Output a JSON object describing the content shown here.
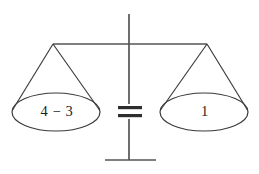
{
  "figure": {
    "background_color": "#ffffff",
    "line_color": "#3a3a3a",
    "post_color": "#555555",
    "text_color": "#1d1d1d"
  },
  "left_pan": {
    "label": "4 − 3",
    "expression_operand_a": "4",
    "expression_operator": "−",
    "expression_operand_b": "3",
    "value": 1
  },
  "right_pan": {
    "label": "1",
    "value": 1
  },
  "center": {
    "relation_symbol": "=",
    "relation_name": "equals-sign"
  },
  "geometry": {
    "beam": {
      "x1": 53,
      "y1": 44,
      "x2": 207,
      "y2": 44
    },
    "post": {
      "x": 129,
      "y_top": 14,
      "y_bottom": 160
    },
    "base": {
      "x1": 105,
      "x2": 156,
      "y": 160
    },
    "left_apex": {
      "x": 53,
      "y": 44
    },
    "right_apex": {
      "x": 207,
      "y": 44
    },
    "left_ellipse": {
      "cx": 56,
      "cy": 112,
      "rx": 44,
      "ry": 19
    },
    "right_ellipse": {
      "cx": 204,
      "cy": 112,
      "rx": 44,
      "ry": 19
    },
    "equals": {
      "x1": 118,
      "x2": 142,
      "y_top": 107,
      "y_bottom": 116,
      "thickness": 3
    }
  }
}
